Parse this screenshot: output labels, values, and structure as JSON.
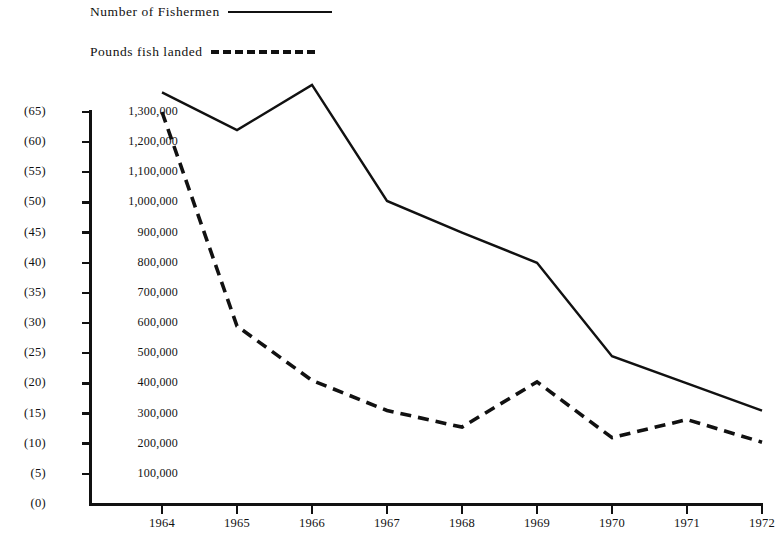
{
  "legend": {
    "items": [
      {
        "label": "Number of Fishermen",
        "style": "solid",
        "key_name": "legend-key-solid"
      },
      {
        "label": "Pounds fish landed",
        "style": "dashed",
        "key_name": "legend-key-dashed"
      }
    ]
  },
  "axes": {
    "left_secondary_labels": [
      "(65)",
      "(60)",
      "(55)",
      "(50)",
      "(45)",
      "(40)",
      "(35)",
      "(30)",
      "(25)",
      "(20)",
      "(15)",
      "(10)",
      "(5)",
      "(0)"
    ],
    "left_primary_labels": [
      "1,300,000",
      "1,200,000",
      "1,100,000",
      "1,000,000",
      "900,000",
      "800,000",
      "700,000",
      "600,000",
      "500,000",
      "400,000",
      "300,000",
      "200,000",
      "100,000"
    ],
    "x_labels": [
      "1964",
      "1965",
      "1966",
      "1967",
      "1968",
      "1969",
      "1970",
      "1971",
      "1972"
    ]
  },
  "chart_data": {
    "type": "line",
    "title": "",
    "xlabel": "",
    "ylabel": "",
    "x": [
      1964,
      1965,
      1966,
      1967,
      1968,
      1969,
      1970,
      1971,
      1972
    ],
    "categories": [
      "1964",
      "1965",
      "1966",
      "1967",
      "1968",
      "1969",
      "1970",
      "1971",
      "1972"
    ],
    "series": [
      {
        "name": "Number of Fishermen",
        "style": "solid",
        "axis": "secondary",
        "values_pounds_scale": [
          1365000,
          1240000,
          1390000,
          1005000,
          900000,
          800000,
          490000,
          400000,
          310000
        ],
        "values": [
          68,
          62,
          69.5,
          50,
          45,
          40,
          24.5,
          20,
          15.5
        ]
      },
      {
        "name": "Pounds fish landed",
        "style": "dashed",
        "axis": "primary",
        "values": [
          1300000,
          590000,
          410000,
          310000,
          255000,
          405000,
          220000,
          280000,
          205000
        ]
      }
    ],
    "primary_axis": {
      "label": "Pounds fish landed",
      "min": 0,
      "max": 1300000,
      "step": 100000
    },
    "secondary_axis": {
      "label": "Number of Fishermen (hundreds)",
      "min": 0,
      "max": 65,
      "step": 5
    },
    "xlim": [
      1964,
      1972
    ],
    "grid": false,
    "legend_position": "top-left"
  },
  "colors": {
    "ink": "#111111",
    "background": "#ffffff"
  }
}
